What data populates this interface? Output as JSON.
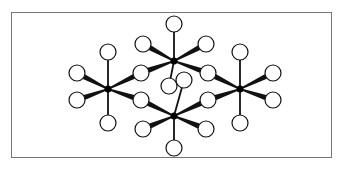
{
  "diagram": {
    "title": "",
    "colors": {
      "stroke": "#111111",
      "circle_fill": "#ffffff",
      "frame": "#777777",
      "center": "#000000"
    },
    "centers": [
      {
        "id": "A",
        "label": ""
      },
      {
        "id": "B",
        "label": ""
      },
      {
        "id": "C",
        "label": ""
      },
      {
        "id": "D",
        "label": ""
      }
    ],
    "ligand_count": 20,
    "bonds": [
      {
        "from": "A",
        "to": "A-top",
        "style": "thin"
      },
      {
        "from": "A",
        "to": "A-bottom",
        "style": "thin"
      },
      {
        "from": "A",
        "to": "A-upper-left",
        "style": "wedge"
      },
      {
        "from": "A",
        "to": "A-lower-left",
        "style": "wedge"
      },
      {
        "from": "A",
        "to": "AB-shared",
        "style": "wedge"
      },
      {
        "from": "A",
        "to": "AC-shared",
        "style": "wedge"
      },
      {
        "from": "B",
        "to": "B-top",
        "style": "thin"
      },
      {
        "from": "B",
        "to": "B-bottom",
        "style": "thin"
      },
      {
        "from": "B",
        "to": "B-upper-left",
        "style": "wedge"
      },
      {
        "from": "B",
        "to": "B-upper-right",
        "style": "wedge"
      },
      {
        "from": "B",
        "to": "AB-shared",
        "style": "wedge"
      },
      {
        "from": "B",
        "to": "BD-shared",
        "style": "wedge"
      },
      {
        "from": "C",
        "to": "C-top",
        "style": "thin"
      },
      {
        "from": "C",
        "to": "C-bottom",
        "style": "thin"
      },
      {
        "from": "C",
        "to": "C-lower-left",
        "style": "wedge"
      },
      {
        "from": "C",
        "to": "C-lower-right",
        "style": "wedge"
      },
      {
        "from": "C",
        "to": "AC-shared",
        "style": "wedge"
      },
      {
        "from": "C",
        "to": "CD-shared",
        "style": "wedge"
      },
      {
        "from": "D",
        "to": "D-top",
        "style": "thin"
      },
      {
        "from": "D",
        "to": "D-bottom",
        "style": "thin"
      },
      {
        "from": "D",
        "to": "D-upper-right",
        "style": "wedge"
      },
      {
        "from": "D",
        "to": "D-lower-right",
        "style": "wedge"
      },
      {
        "from": "D",
        "to": "BD-shared",
        "style": "wedge"
      },
      {
        "from": "D",
        "to": "CD-shared",
        "style": "wedge"
      }
    ]
  }
}
